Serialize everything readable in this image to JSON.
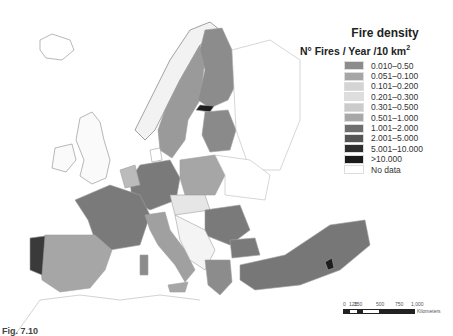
{
  "legend": {
    "title": "Fire density",
    "unit_main": "N° Fires / Year /10 km",
    "unit_sup": "2",
    "items": [
      {
        "label": "0.010–0.50",
        "color": "#8c8c8c"
      },
      {
        "label": "0.051–0.100",
        "color": "#a6a6a6"
      },
      {
        "label": "0.101–0.200",
        "color": "#d4d4d4"
      },
      {
        "label": "0.201–0.300",
        "color": "#dedede"
      },
      {
        "label": "0.301–0.500",
        "color": "#cbcbcb"
      },
      {
        "label": "0.501–1.000",
        "color": "#a8a8a8"
      },
      {
        "label": "1.001–2.000",
        "color": "#6e6e6e"
      },
      {
        "label": "2.001–5.000",
        "color": "#555555"
      },
      {
        "label": "5.001–10.000",
        "color": "#2e2e2e"
      },
      {
        "label": ">10.000",
        "color": "#1a1a1a"
      },
      {
        "label": "No data",
        "color": "#ffffff"
      }
    ]
  },
  "scalebar": {
    "ticks": [
      "0",
      "125",
      "250",
      "500",
      "750",
      "1,000"
    ],
    "unit": "Kilometers"
  },
  "caption": "Fig. 7.10",
  "map": {
    "colors": {
      "low": "#8c8c8c",
      "light": "#c8c8c8",
      "mid": "#7a7a7a",
      "high": "#4a4a4a",
      "max": "#1e1e1e",
      "nodata": "#ffffff",
      "border": "#9a9a9a"
    }
  }
}
